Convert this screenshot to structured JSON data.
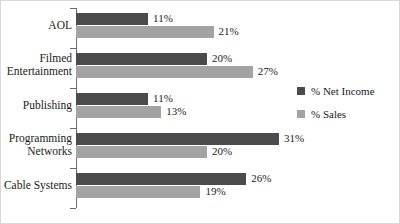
{
  "chart_data": {
    "type": "bar",
    "orientation": "horizontal",
    "title": "",
    "xlabel": "",
    "ylabel": "",
    "grid": false,
    "xlim": [
      0,
      35
    ],
    "categories": [
      "AOL",
      "Filmed\nEntertainment",
      "Publishing",
      "Programming\nNetworks",
      "Cable Systems"
    ],
    "series": [
      {
        "name": "% Net Income",
        "color": "#4b4b4b",
        "values": [
          11,
          20,
          11,
          31,
          26
        ],
        "labels": [
          "11%",
          "20%",
          "11%",
          "31%",
          "26%"
        ]
      },
      {
        "name": "% Sales",
        "color": "#a3a3a3",
        "values": [
          21,
          27,
          13,
          20,
          19
        ],
        "labels": [
          "21%",
          "27%",
          "13%",
          "20%",
          "19%"
        ]
      }
    ],
    "legend": {
      "position": "right",
      "entries": [
        {
          "label": "% Net Income",
          "color": "#4b4b4b"
        },
        {
          "label": "% Sales",
          "color": "#a3a3a3"
        }
      ]
    },
    "axis": {
      "value_axis_color": "#6b6b6b",
      "tick_count": 6
    }
  }
}
